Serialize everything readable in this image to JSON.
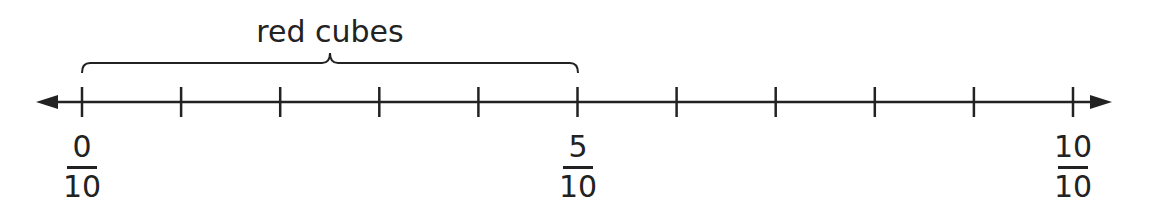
{
  "diagram": {
    "type": "number_line",
    "bracket_label": "red cubes",
    "bracket_range": [
      0,
      5
    ],
    "tick_count": 11,
    "labels": [
      {
        "position": 0,
        "numerator": "0",
        "denominator": "10"
      },
      {
        "position": 5,
        "numerator": "5",
        "denominator": "10"
      },
      {
        "position": 10,
        "numerator": "10",
        "denominator": "10"
      }
    ],
    "line_color": "#222222"
  }
}
